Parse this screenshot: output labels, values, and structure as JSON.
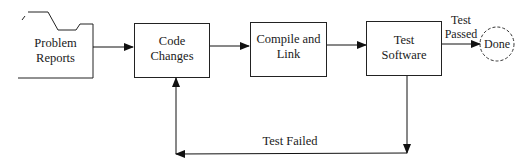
{
  "diagram": {
    "type": "flowchart",
    "nodes": [
      {
        "id": "problem_reports",
        "shape": "folder",
        "line1": "Problem",
        "line2": "Reports"
      },
      {
        "id": "code_changes",
        "shape": "box",
        "line1": "Code",
        "line2": "Changes"
      },
      {
        "id": "compile_link",
        "shape": "box",
        "line1": "Compile and",
        "line2": "Link"
      },
      {
        "id": "test_software",
        "shape": "box",
        "line1": "Test",
        "line2": "Software"
      },
      {
        "id": "done",
        "shape": "dashed-circle",
        "label": "Done"
      }
    ],
    "edges": [
      {
        "from": "problem_reports",
        "to": "code_changes",
        "label": ""
      },
      {
        "from": "code_changes",
        "to": "compile_link",
        "label": ""
      },
      {
        "from": "compile_link",
        "to": "test_software",
        "label": ""
      },
      {
        "from": "test_software",
        "to": "done",
        "line1": "Test",
        "line2": "Passed"
      },
      {
        "from": "test_software",
        "to": "code_changes",
        "label": "Test Failed"
      }
    ]
  }
}
